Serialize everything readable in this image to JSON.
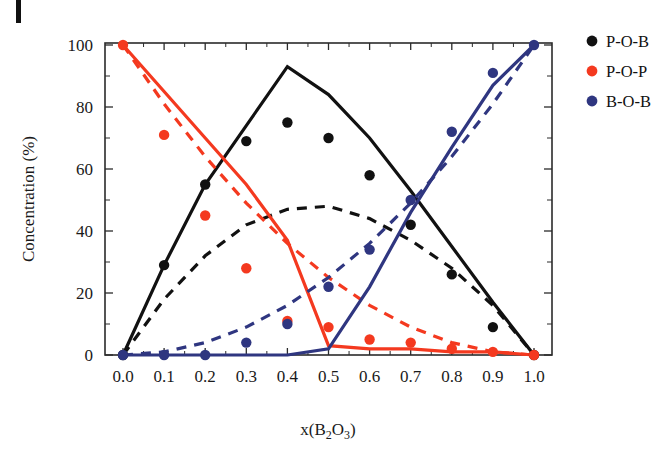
{
  "figure": {
    "corner_mark": "panel-marker",
    "background": "#ffffff"
  },
  "colors": {
    "black": "#111111",
    "red": "#f4391f",
    "blue": "#2f3680",
    "axis": "#2b2b2b"
  },
  "axes": {
    "x_title": "x(B₂O₃)",
    "x_title_plain": "x(B2O3)",
    "y_title": "Concentration (%)",
    "x_ticks": [
      "0.0",
      "0.1",
      "0.2",
      "0.3",
      "0.4",
      "0.5",
      "0.6",
      "0.7",
      "0.8",
      "0.9",
      "1.0"
    ],
    "y_ticks": [
      "0",
      "20",
      "40",
      "60",
      "80",
      "100"
    ],
    "xlim": [
      0.0,
      1.0
    ],
    "ylim": [
      0,
      100
    ]
  },
  "legend": {
    "position": "top-right-outside",
    "items": [
      {
        "label": "P-O-B",
        "color": "#111111",
        "marker": "circle"
      },
      {
        "label": "P-O-P",
        "color": "#f4391f",
        "marker": "circle"
      },
      {
        "label": "B-O-B",
        "color": "#2f3680",
        "marker": "circle"
      }
    ]
  },
  "chart_data": {
    "type": "line",
    "title": "",
    "xlabel": "x(B2O3)",
    "ylabel": "Concentration (%)",
    "xlim": [
      0.0,
      1.0
    ],
    "ylim": [
      0,
      100
    ],
    "grid": false,
    "legend_position": "top-right-outside",
    "x": [
      0.0,
      0.1,
      0.2,
      0.3,
      0.4,
      0.5,
      0.6,
      0.7,
      0.8,
      0.9,
      1.0
    ],
    "series": [
      {
        "name": "P-O-B",
        "color": "#111111",
        "style": "solid",
        "role": "model-solid",
        "values": [
          0,
          29,
          55,
          74,
          93,
          84,
          70,
          53,
          35,
          17,
          0
        ]
      },
      {
        "name": "P-O-B",
        "color": "#111111",
        "style": "dashed",
        "role": "model-dashed",
        "values": [
          0,
          18,
          32,
          42,
          47,
          48,
          44,
          37,
          28,
          16,
          0
        ]
      },
      {
        "name": "P-O-B",
        "color": "#111111",
        "style": "markers",
        "role": "experimental-points",
        "values": [
          0,
          29,
          55,
          69,
          75,
          70,
          58,
          42,
          26,
          9,
          0
        ]
      },
      {
        "name": "P-O-P",
        "color": "#f4391f",
        "style": "solid",
        "role": "model-solid",
        "values": [
          100,
          85,
          70,
          55,
          37,
          3,
          2,
          2,
          1,
          1,
          0
        ]
      },
      {
        "name": "P-O-P",
        "color": "#f4391f",
        "style": "dashed",
        "role": "model-dashed",
        "values": [
          100,
          81,
          64,
          49,
          36,
          25,
          16,
          9,
          4,
          1,
          0
        ]
      },
      {
        "name": "P-O-P",
        "color": "#f4391f",
        "style": "markers",
        "role": "experimental-points",
        "values": [
          100,
          71,
          45,
          28,
          11,
          9,
          5,
          4,
          2,
          1,
          0
        ]
      },
      {
        "name": "B-O-B",
        "color": "#2f3680",
        "style": "solid",
        "role": "model-solid",
        "values": [
          0,
          0,
          0,
          0,
          0,
          2,
          22,
          46,
          67,
          87,
          100
        ]
      },
      {
        "name": "B-O-B",
        "color": "#2f3680",
        "style": "dashed",
        "role": "model-dashed",
        "values": [
          0,
          1,
          4,
          9,
          16,
          25,
          36,
          49,
          64,
          81,
          100
        ]
      },
      {
        "name": "B-O-B",
        "color": "#2f3680",
        "style": "markers",
        "role": "experimental-points",
        "values": [
          0,
          0,
          0,
          4,
          10,
          22,
          34,
          50,
          72,
          91,
          100
        ]
      }
    ]
  }
}
